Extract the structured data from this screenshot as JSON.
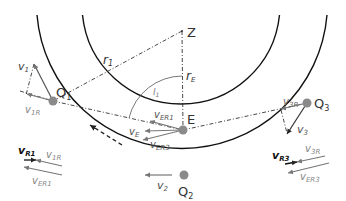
{
  "diagram": {
    "colors": {
      "orbit": "#111111",
      "construction": "#333333",
      "vector_gray": "#777777",
      "vector_dark": "#111111",
      "point_fill": "#8a8a8a",
      "label_dark": "#222222",
      "label_gray": "#777777"
    },
    "points": {
      "Z": "Z",
      "E": "E",
      "Q1": "Q",
      "Q1_sub": "1",
      "Q2": "Q",
      "Q2_sub": "2",
      "Q3": "Q",
      "Q3_sub": "3"
    },
    "radii": {
      "r1": "r",
      "r1_sub": "1",
      "rE": "r",
      "rE_sub": "E"
    },
    "angle": {
      "label": "l",
      "label_sub": "1"
    },
    "vectors": {
      "v1": {
        "main": "v",
        "sub": "1"
      },
      "v1R": {
        "main": "v",
        "sub": "1R"
      },
      "v2": {
        "main": "v",
        "sub": "2"
      },
      "v3": {
        "main": "v",
        "sub": "3"
      },
      "v3R": {
        "main": "v",
        "sub": "3R"
      },
      "vE": {
        "main": "v",
        "sub": "E"
      },
      "vER1": {
        "main": "v",
        "sub": "ER1"
      },
      "vER3": {
        "main": "v",
        "sub": "ER3"
      },
      "vR1": {
        "main": "v",
        "sub": "R1"
      },
      "vR3": {
        "main": "v",
        "sub": "R3"
      }
    },
    "legend_left": {
      "vR1": {
        "main": "v",
        "sub": "R1"
      },
      "v1R": {
        "main": "v",
        "sub": "1R"
      },
      "vER1": {
        "main": "v",
        "sub": "ER1"
      }
    },
    "legend_right": {
      "vR3": {
        "main": "v",
        "sub": "R3"
      },
      "v3R": {
        "main": "v",
        "sub": "3R"
      },
      "vER3": {
        "main": "v",
        "sub": "ER3"
      }
    }
  }
}
